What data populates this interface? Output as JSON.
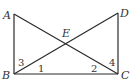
{
  "diagram": {
    "vertices": {
      "A": "A",
      "B": "B",
      "C": "C",
      "D": "D",
      "E": "E"
    },
    "segments": [
      "AB",
      "BC",
      "CD",
      "AC",
      "BD"
    ],
    "angle_labels": {
      "angle1": "1",
      "angle2": "2",
      "angle3": "3",
      "angle4": "4"
    },
    "stroke_color": "#2a2a2a",
    "label_color": "#333333"
  }
}
